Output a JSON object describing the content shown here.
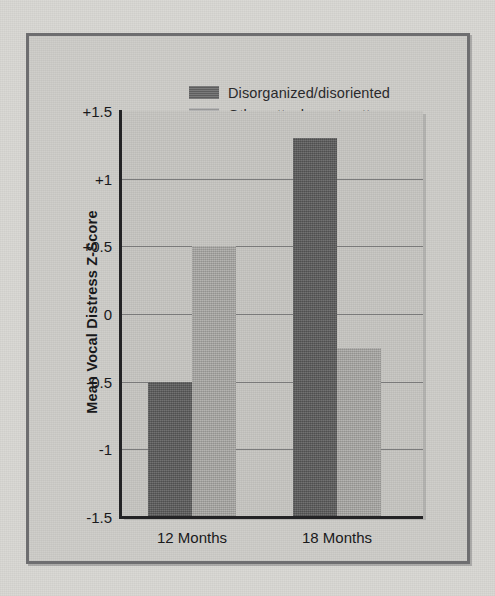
{
  "figure": {
    "frame_color": "#6e6e70",
    "paper_color": "#d8d7d3",
    "plot_background": "#c6c5c1"
  },
  "legend": {
    "position": "top-center",
    "items": [
      {
        "label": "Disorganized/disoriented",
        "color": "#5f5f5f",
        "swatch": "dark"
      },
      {
        "label": "Other attachment patterns",
        "color": "#a9a8a5",
        "swatch": "light"
      }
    ]
  },
  "chart_data": {
    "type": "bar",
    "title": "",
    "subtitle": "",
    "xlabel": "",
    "ylabel": "Mean Vocal Distress  Z-Score",
    "categories": [
      "12 Months",
      "18 Months"
    ],
    "series": [
      {
        "name": "Disorganized/disoriented",
        "color": "#5f5f5f",
        "values": [
          -0.5,
          1.3
        ]
      },
      {
        "name": "Other attachment patterns",
        "color": "#a9a8a5",
        "values": [
          0.5,
          -0.25
        ]
      }
    ],
    "ylim": [
      -1.5,
      1.5
    ],
    "yticks": [
      1.5,
      1,
      0.5,
      0,
      -0.5,
      -1,
      -1.5
    ],
    "ytick_labels": [
      "+1.5",
      "+1",
      "+0.5",
      "0",
      "-0.5",
      "-1",
      "-1.5"
    ],
    "gridlines": [
      1,
      0.5,
      0,
      -0.5,
      -1
    ],
    "grid": true,
    "bars_drawn_from": -1.5,
    "legend_position": "top-center",
    "annotations": []
  }
}
